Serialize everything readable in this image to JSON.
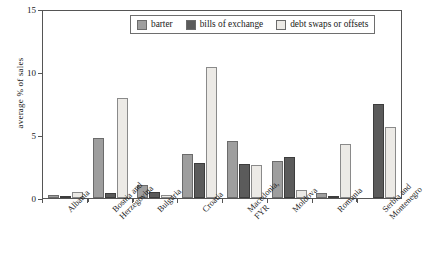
{
  "chart_data": {
    "type": "bar",
    "title": "",
    "xlabel": "",
    "ylabel": "average % of sales",
    "ylim": [
      0,
      15
    ],
    "yticks": [
      0,
      5,
      10,
      15
    ],
    "grid": false,
    "legend_position": "top-center",
    "categories": [
      "Albania",
      "Bosnia and Herzegovina",
      "Bulgaria",
      "Croatia",
      "Macedonia, FYR",
      "Moldova",
      "Romania",
      "Serbia and Montenegro"
    ],
    "category_lines": [
      [
        "Albania"
      ],
      [
        "Bosnia and",
        "Herzegovina"
      ],
      [
        "Bulgaria"
      ],
      [
        "Croatia"
      ],
      [
        "Macedonia,",
        "FYR"
      ],
      [
        "Moldova"
      ],
      [
        "Romania"
      ],
      [
        "Serbia and",
        "Montenegro"
      ]
    ],
    "series": [
      {
        "name": "barter",
        "color": "#9e9e9e",
        "values": [
          0.2,
          4.8,
          1.0,
          3.5,
          4.5,
          2.9,
          0.4,
          0.0
        ]
      },
      {
        "name": "bills of exchange",
        "color": "#5b5b5b",
        "values": [
          0.05,
          0.4,
          0.45,
          2.75,
          2.7,
          3.25,
          0.05,
          7.5
        ]
      },
      {
        "name": "debt swaps or offsets",
        "color": "#eceae6",
        "values": [
          0.45,
          7.9,
          0.2,
          10.4,
          2.6,
          0.6,
          4.25,
          5.6
        ]
      }
    ]
  }
}
